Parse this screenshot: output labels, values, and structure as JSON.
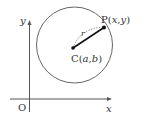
{
  "diagram": {
    "axes": {
      "x_label": "x",
      "y_label": "y",
      "origin_label": "O"
    },
    "circle": {
      "center_label_prefix": "C(",
      "center_a": "a",
      "center_sep": ",",
      "center_b": "b",
      "center_label_suffix": ")",
      "radius_label": "r"
    },
    "point": {
      "label_prefix": "P(",
      "x": "x",
      "sep": ",",
      "y": "y",
      "label_suffix": ")"
    },
    "colors": {
      "stroke": "#555555",
      "radius_segment": "#111111",
      "text": "#333333"
    }
  }
}
